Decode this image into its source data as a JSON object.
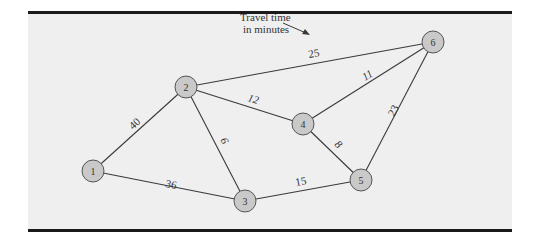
{
  "figure": {
    "panel_background": "#efefef",
    "border_color": "#1a1a1a",
    "node_fill": "#c9c9c9",
    "node_stroke": "#555555",
    "edge_color": "#3a3a3a"
  },
  "annotation": {
    "line1": "Travel time",
    "line2": "in minutes"
  },
  "nodes": [
    {
      "id": "1",
      "label": "1",
      "x": 93,
      "y": 171
    },
    {
      "id": "2",
      "label": "2",
      "x": 186,
      "y": 87
    },
    {
      "id": "3",
      "label": "3",
      "x": 245,
      "y": 201
    },
    {
      "id": "4",
      "label": "4",
      "x": 303,
      "y": 124
    },
    {
      "id": "5",
      "label": "5",
      "x": 361,
      "y": 180
    },
    {
      "id": "6",
      "label": "6",
      "x": 433,
      "y": 42
    }
  ],
  "edges": [
    {
      "from": "1",
      "to": "2",
      "weight": "40"
    },
    {
      "from": "1",
      "to": "3",
      "weight": "36"
    },
    {
      "from": "2",
      "to": "3",
      "weight": "6"
    },
    {
      "from": "2",
      "to": "4",
      "weight": "12"
    },
    {
      "from": "2",
      "to": "6",
      "weight": "25"
    },
    {
      "from": "3",
      "to": "5",
      "weight": "15"
    },
    {
      "from": "4",
      "to": "5",
      "weight": "8"
    },
    {
      "from": "4",
      "to": "6",
      "weight": "11"
    },
    {
      "from": "5",
      "to": "6",
      "weight": "23"
    }
  ]
}
